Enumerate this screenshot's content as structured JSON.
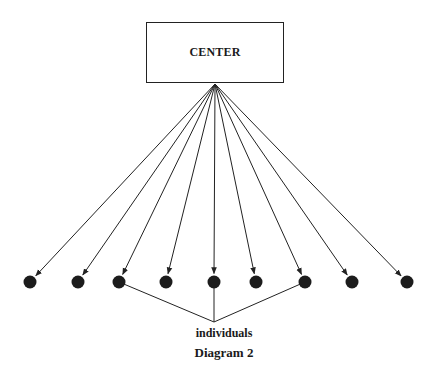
{
  "diagram": {
    "center_label": "CENTER",
    "group_label": "individuals",
    "title": "Diagram 2",
    "colors": {
      "stroke": "#222222",
      "node_fill": "#1c1c1c",
      "background": "#ffffff"
    },
    "hub": {
      "x": 215,
      "y": 84
    },
    "nodes": [
      {
        "id": "individual-1",
        "x": 30,
        "y": 282,
        "grouped": false
      },
      {
        "id": "individual-2",
        "x": 78,
        "y": 282,
        "grouped": false
      },
      {
        "id": "individual-3",
        "x": 119,
        "y": 282,
        "grouped": true
      },
      {
        "id": "individual-4",
        "x": 166,
        "y": 282,
        "grouped": false
      },
      {
        "id": "individual-5",
        "x": 214,
        "y": 282,
        "grouped": true
      },
      {
        "id": "individual-6",
        "x": 256,
        "y": 282,
        "grouped": false
      },
      {
        "id": "individual-7",
        "x": 305,
        "y": 282,
        "grouped": true
      },
      {
        "id": "individual-8",
        "x": 352,
        "y": 282,
        "grouped": false
      },
      {
        "id": "individual-9",
        "x": 407,
        "y": 282,
        "grouped": false
      }
    ],
    "group_point": {
      "x": 214,
      "y": 322
    }
  }
}
